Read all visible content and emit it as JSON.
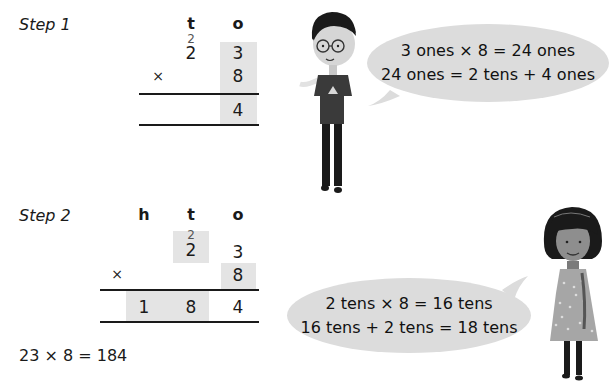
{
  "step1": {
    "label": "Step 1",
    "headers": {
      "t": "t",
      "o": "o"
    },
    "carry_t": "2",
    "row1": {
      "t": "2",
      "o": "3"
    },
    "operator": "×",
    "row2": {
      "o": "8"
    },
    "result": {
      "o": "4"
    },
    "bubble": {
      "line1": "3 ones × 8 = 24 ones",
      "line2": "24 ones = 2 tens + 4 ones"
    }
  },
  "step2": {
    "label": "Step 2",
    "headers": {
      "h": "h",
      "t": "t",
      "o": "o"
    },
    "carry_t": "2",
    "row1": {
      "t": "2",
      "o": "3"
    },
    "operator": "×",
    "row2": {
      "o": "8"
    },
    "result": {
      "h": "1",
      "t": "8",
      "o": "4"
    },
    "bubble": {
      "line1": "2 tens × 8 = 16 tens",
      "line2": "16 tens + 2 tens = 18 tens"
    }
  },
  "final_equation": "23 × 8 = 184",
  "colors": {
    "shade": "#e4e4e4",
    "bubble": "#dcdcdc",
    "text": "#1a1a1a"
  }
}
